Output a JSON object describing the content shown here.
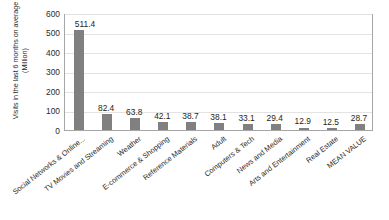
{
  "chart_data": {
    "type": "bar",
    "title": "",
    "xlabel": "",
    "ylabel": "Visits in the last 6 months on average",
    "yunit": "(Million)",
    "ylim": [
      0,
      600
    ],
    "yticks": [
      600,
      500,
      400,
      300,
      200,
      100,
      0
    ],
    "grid": true,
    "legend": "none",
    "bar_color": "#808080",
    "categories": [
      "Social Networks & Online...",
      "TV Movies and Streaming",
      "Weather",
      "E-commerce & Shopping",
      "Reference Materials",
      "Adult",
      "Computers & Tech",
      "News and Media",
      "Arts and Entertainment",
      "Real Estate",
      "MEAN VALUE"
    ],
    "values": [
      511.4,
      82.4,
      63.8,
      42.1,
      38.7,
      38.1,
      33.1,
      29.4,
      12.9,
      12.5,
      28.7
    ],
    "value_labels": [
      "511.4",
      "82.4",
      "63.8",
      "42.1",
      "38.7",
      "38.1",
      "33.1",
      "29.4",
      "12.9",
      "12.5",
      "28.7"
    ]
  }
}
